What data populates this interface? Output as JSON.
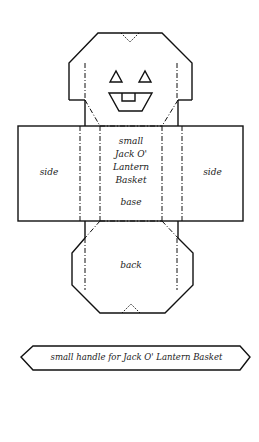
{
  "template": {
    "title": "small Jack O' Lantern Basket",
    "panels": {
      "left_side": "side",
      "right_side": "side",
      "base_title_lines": [
        "small",
        "Jack O'",
        "Lantern",
        "Basket"
      ],
      "base_label": "base",
      "back_label": "back"
    },
    "handle": {
      "label": "small handle for Jack O' Lantern Basket"
    },
    "colors": {
      "line": "#111111",
      "background": "#ffffff"
    }
  }
}
